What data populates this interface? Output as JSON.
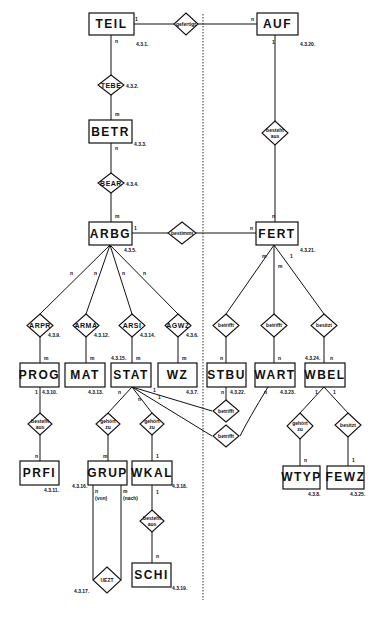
{
  "diagram": {
    "type": "entity-relationship",
    "entities": [
      {
        "id": "TEIL",
        "label": "TEIL",
        "ref": "4.3.1."
      },
      {
        "id": "AUF",
        "label": "AUF",
        "ref": "4.3.20."
      },
      {
        "id": "BETR",
        "label": "BETR",
        "ref": "4.3.3."
      },
      {
        "id": "ARBG",
        "label": "ARBG",
        "ref": "4.3.5."
      },
      {
        "id": "FERT",
        "label": "FERT",
        "ref": "4.3.21."
      },
      {
        "id": "PROG",
        "label": "PROG",
        "ref": "4.3.10."
      },
      {
        "id": "MAT",
        "label": "MAT",
        "ref": "4.3.13."
      },
      {
        "id": "STAT",
        "label": "STAT",
        "ref": "4.3.15."
      },
      {
        "id": "WZ",
        "label": "WZ",
        "ref": "4.3.7."
      },
      {
        "id": "STBU",
        "label": "STBU",
        "ref": "4.3.22."
      },
      {
        "id": "WART",
        "label": "WART",
        "ref": "4.3.23."
      },
      {
        "id": "WBEL",
        "label": "WBEL",
        "ref": "4.3.24."
      },
      {
        "id": "PRFI",
        "label": "PRFI",
        "ref": "4.3.11."
      },
      {
        "id": "GRUP",
        "label": "GRUP",
        "ref": "4.3.16."
      },
      {
        "id": "WKAL",
        "label": "WKAL",
        "ref": "4.3.18."
      },
      {
        "id": "WTYP",
        "label": "WTYP",
        "ref": "4.3.8."
      },
      {
        "id": "FEWZ",
        "label": "FEWZ",
        "ref": "4.3.25."
      },
      {
        "id": "SCHI",
        "label": "SCHI",
        "ref": "4.3.19."
      }
    ],
    "relationships": [
      {
        "id": "r_gefertigt",
        "label": "gefertigt",
        "line2": ""
      },
      {
        "id": "r_TEBE",
        "label": "TEBE",
        "line2": "",
        "ref": "4.3.2."
      },
      {
        "id": "r_BEAR",
        "label": "BEAR",
        "line2": "",
        "ref": "4.3.4."
      },
      {
        "id": "r_besteht_auf",
        "label": "besteht",
        "line2": "aus"
      },
      {
        "id": "r_bestimmt",
        "label": "bestimmt",
        "line2": ""
      },
      {
        "id": "r_ARPR",
        "label": "ARPR",
        "line2": "",
        "ref": "4.3.9."
      },
      {
        "id": "r_ARMA",
        "label": "ARMA",
        "line2": "",
        "ref": "4.3.12."
      },
      {
        "id": "r_ARSI",
        "label": "ARSI",
        "line2": "",
        "ref": "4.3.14."
      },
      {
        "id": "r_AGWZ",
        "label": "AGWZ",
        "line2": "",
        "ref": "4.3.6."
      },
      {
        "id": "r_betrifft1",
        "label": "betrifft",
        "line2": ""
      },
      {
        "id": "r_betrifft2",
        "label": "betrifft",
        "line2": ""
      },
      {
        "id": "r_besitzt1",
        "label": "besitzt",
        "line2": ""
      },
      {
        "id": "r_besteht_prog",
        "label": "besteht",
        "line2": "aus"
      },
      {
        "id": "r_gehoert_grup",
        "label": "gehört",
        "line2": "zu"
      },
      {
        "id": "r_gehoert_wkal",
        "label": "gehört",
        "line2": "zu"
      },
      {
        "id": "r_betrifft_s1",
        "label": "betrifft",
        "line2": ""
      },
      {
        "id": "r_betrifft_s2",
        "label": "betrifft",
        "line2": ""
      },
      {
        "id": "r_gehoert_wtyp",
        "label": "gehört",
        "line2": "zu"
      },
      {
        "id": "r_besitzt2",
        "label": "besitzt",
        "line2": ""
      },
      {
        "id": "r_besteht_schi",
        "label": "besteht",
        "line2": "aus"
      },
      {
        "id": "r_UEZT",
        "label": "UEZT",
        "line2": "",
        "ref": "4.3.17."
      }
    ],
    "cardinalities": {
      "teil_gef": "1",
      "auf_gef": "n",
      "teil_tebe": "n",
      "auf_bes": "1",
      "betr_tebe": "m",
      "betr_bear": "n",
      "arbg_bear": "m",
      "fert_bes": "n",
      "arbg_best": "1",
      "fert_best": "n",
      "arbg_arpr": "n",
      "arbg_arma": "n",
      "arbg_arsi": "n",
      "arbg_agwz": "n",
      "prog_arpr": "m",
      "mat_arma": "m",
      "stat_arsi": "m",
      "wz_agwz": "m",
      "fert_b1": "m",
      "fert_b2": "m",
      "fert_bes1": "1",
      "stbu_b1": "n",
      "wart_b2": "n",
      "wbel_bes1": "n",
      "prog_bestaus": "1",
      "prfi_bestaus": "n",
      "stat_grup": "n",
      "stat_wkal": "n",
      "stat_s1": "1",
      "stat_s2": "1",
      "grup_geh": "m",
      "wkal_geh": "1",
      "stbu_s1": "n",
      "wart_s2": "n",
      "wbel_wtyp": "1",
      "wbel_fewz": "1",
      "wtyp_geh": "n",
      "fewz_bes": "1",
      "wkal_schi": "1",
      "schi_bes": "n",
      "grup_von": "n",
      "grup_nach": "m",
      "von_label": "(von)",
      "nach_label": "(nach)"
    }
  }
}
